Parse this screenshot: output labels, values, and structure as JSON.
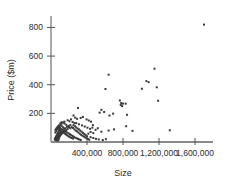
{
  "chart_data": {
    "type": "scatter",
    "title": "",
    "xlabel": "Size",
    "ylabel": "Price ($m)",
    "xlim": [
      0,
      1800000
    ],
    "ylim": [
      0,
      880
    ],
    "xticks": [
      400000,
      800000,
      1200000,
      1600000
    ],
    "xtick_labels": [
      "400,000",
      "800,000",
      "1,200,000",
      "1,600,000"
    ],
    "yticks": [
      200,
      400,
      600,
      800
    ],
    "ytick_labels": [
      "200",
      "400",
      "600",
      "800"
    ],
    "grid": false,
    "legend": "none",
    "marker_color": "#3a3a3a",
    "marker_size": 2,
    "series": [
      {
        "name": "properties",
        "points": [
          [
            1700000,
            820
          ],
          [
            1150000,
            512
          ],
          [
            640000,
            470
          ],
          [
            1060000,
            425
          ],
          [
            1085000,
            418
          ],
          [
            1175000,
            382
          ],
          [
            605000,
            370
          ],
          [
            1010000,
            372
          ],
          [
            1190000,
            288
          ],
          [
            765000,
            290
          ],
          [
            780000,
            272
          ],
          [
            800000,
            268
          ],
          [
            775000,
            258
          ],
          [
            790000,
            250
          ],
          [
            830000,
            268
          ],
          [
            845000,
            190
          ],
          [
            560000,
            225
          ],
          [
            590000,
            210
          ],
          [
            540000,
            205
          ],
          [
            300000,
            238
          ],
          [
            690000,
            198
          ],
          [
            650000,
            185
          ],
          [
            355000,
            175
          ],
          [
            330000,
            168
          ],
          [
            290000,
            162
          ],
          [
            395000,
            158
          ],
          [
            420000,
            150
          ],
          [
            445000,
            142
          ],
          [
            250000,
            185
          ],
          [
            268000,
            170
          ],
          [
            222000,
            158
          ],
          [
            835000,
            110
          ],
          [
            1320000,
            82
          ],
          [
            905000,
            78
          ],
          [
            700000,
            88
          ],
          [
            640000,
            80
          ],
          [
            560000,
            72
          ],
          [
            520000,
            96
          ],
          [
            495000,
            85
          ],
          [
            470000,
            62
          ],
          [
            440000,
            70
          ],
          [
            415000,
            58
          ],
          [
            460000,
            100
          ],
          [
            205000,
            145
          ],
          [
            185000,
            152
          ],
          [
            240000,
            140
          ],
          [
            260000,
            132
          ],
          [
            150000,
            128
          ],
          [
            170000,
            120
          ],
          [
            195000,
            112
          ],
          [
            215000,
            118
          ],
          [
            120000,
            110
          ],
          [
            135000,
            102
          ],
          [
            158000,
            96
          ],
          [
            178000,
            106
          ],
          [
            100000,
            98
          ],
          [
            112000,
            90
          ],
          [
            128000,
            86
          ],
          [
            145000,
            92
          ],
          [
            90000,
            84
          ],
          [
            105000,
            78
          ],
          [
            120000,
            74
          ],
          [
            138000,
            80
          ],
          [
            82000,
            72
          ],
          [
            95000,
            68
          ],
          [
            110000,
            64
          ],
          [
            125000,
            70
          ],
          [
            75000,
            62
          ],
          [
            88000,
            58
          ],
          [
            100000,
            54
          ],
          [
            115000,
            60
          ],
          [
            70000,
            52
          ],
          [
            80000,
            48
          ],
          [
            92000,
            44
          ],
          [
            105000,
            50
          ],
          [
            65000,
            42
          ],
          [
            75000,
            38
          ],
          [
            85000,
            34
          ],
          [
            98000,
            40
          ],
          [
            60000,
            32
          ],
          [
            70000,
            28
          ],
          [
            80000,
            24
          ],
          [
            90000,
            30
          ],
          [
            55000,
            22
          ],
          [
            65000,
            18
          ],
          [
            75000,
            16
          ],
          [
            85000,
            20
          ],
          [
            50000,
            14
          ],
          [
            60000,
            12
          ],
          [
            70000,
            10
          ],
          [
            80000,
            13
          ],
          [
            45000,
            26
          ],
          [
            55000,
            36
          ],
          [
            65000,
            46
          ],
          [
            78000,
            56
          ],
          [
            48000,
            66
          ],
          [
            58000,
            76
          ],
          [
            68000,
            88
          ],
          [
            78000,
            96
          ],
          [
            42000,
            18
          ],
          [
            52000,
            30
          ],
          [
            62000,
            42
          ],
          [
            72000,
            54
          ],
          [
            148000,
            62
          ],
          [
            160000,
            56
          ],
          [
            172000,
            50
          ],
          [
            185000,
            44
          ],
          [
            200000,
            38
          ],
          [
            215000,
            32
          ],
          [
            230000,
            28
          ],
          [
            245000,
            24
          ],
          [
            165000,
            72
          ],
          [
            180000,
            66
          ],
          [
            195000,
            60
          ],
          [
            210000,
            54
          ],
          [
            225000,
            48
          ],
          [
            240000,
            42
          ],
          [
            255000,
            36
          ],
          [
            270000,
            30
          ],
          [
            285000,
            26
          ],
          [
            300000,
            22
          ],
          [
            315000,
            18
          ],
          [
            330000,
            14
          ],
          [
            260000,
            88
          ],
          [
            275000,
            80
          ],
          [
            290000,
            74
          ],
          [
            305000,
            66
          ],
          [
            320000,
            58
          ],
          [
            335000,
            50
          ],
          [
            350000,
            44
          ],
          [
            365000,
            38
          ],
          [
            380000,
            32
          ],
          [
            395000,
            26
          ],
          [
            410000,
            22
          ],
          [
            425000,
            16
          ],
          [
            230000,
            104
          ],
          [
            245000,
            98
          ],
          [
            215000,
            96
          ],
          [
            200000,
            104
          ],
          [
            185000,
            92
          ],
          [
            170000,
            84
          ],
          [
            155000,
            78
          ],
          [
            140000,
            70
          ],
          [
            130000,
            64
          ],
          [
            118000,
            58
          ],
          [
            108000,
            52
          ],
          [
            96000,
            46
          ],
          [
            250000,
            118
          ],
          [
            265000,
            110
          ],
          [
            280000,
            102
          ],
          [
            295000,
            94
          ],
          [
            310000,
            88
          ],
          [
            325000,
            80
          ],
          [
            340000,
            72
          ],
          [
            355000,
            64
          ],
          [
            370000,
            56
          ],
          [
            385000,
            48
          ],
          [
            400000,
            40
          ],
          [
            440000,
            34
          ],
          [
            470000,
            28
          ],
          [
            500000,
            22
          ],
          [
            530000,
            18
          ],
          [
            575000,
            14
          ],
          [
            610000,
            20
          ],
          [
            280000,
            132
          ],
          [
            310000,
            124
          ],
          [
            345000,
            116
          ],
          [
            375000,
            108
          ],
          [
            405000,
            100
          ],
          [
            435000,
            92
          ],
          [
            465000,
            118
          ],
          [
            86000,
            104
          ],
          [
            96000,
            112
          ],
          [
            106000,
            120
          ],
          [
            116000,
            128
          ],
          [
            58000,
            92
          ],
          [
            68000,
            100
          ],
          [
            78000,
            108
          ],
          [
            88000,
            116
          ],
          [
            50000,
            84
          ],
          [
            62000,
            94
          ],
          [
            74000,
            102
          ],
          [
            84000,
            110
          ],
          [
            135000,
            136
          ],
          [
            150000,
            142
          ],
          [
            118000,
            138
          ],
          [
            104000,
            130
          ]
        ]
      }
    ]
  }
}
